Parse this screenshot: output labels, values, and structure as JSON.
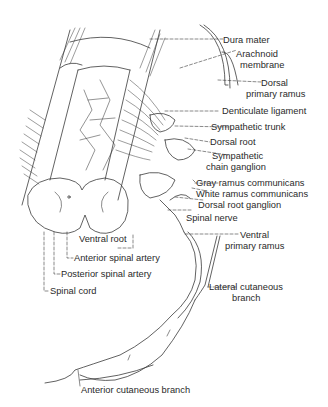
{
  "figure": {
    "line_color": "#3a3a3a",
    "background": "#ffffff"
  },
  "labels": {
    "dura_mater": "Dura mater",
    "arachnoid_membrane_1": "Arachnoid",
    "arachnoid_membrane_2": "membrane",
    "dorsal_primary_ramus_1": "Dorsal",
    "dorsal_primary_ramus_2": "primary ramus",
    "denticulate_ligament": "Denticulate ligament",
    "sympathetic_trunk": "Sympathetic trunk",
    "dorsal_root": "Dorsal root",
    "sympathetic_chain_ganglion_1": "Sympathetic",
    "sympathetic_chain_ganglion_2": "chain ganglion",
    "gray_ramus_communicans": "Gray ramus communicans",
    "white_ramus_communicans": "White ramus communicans",
    "dorsal_root_ganglion": "Dorsal root ganglion",
    "spinal_nerve": "Spinal nerve",
    "ventral_primary_ramus_1": "Ventral",
    "ventral_primary_ramus_2": "primary ramus",
    "ventral_root": "Ventral root",
    "anterior_spinal_artery": "Anterior spinal artery",
    "posterior_spinal_artery": "Posterior spinal artery",
    "spinal_cord": "Spinal cord",
    "lateral_cutaneous_branch_1": "Lateral cutaneous",
    "lateral_cutaneous_branch_2": "branch",
    "anterior_cutaneous_branch": "Anterior cutaneous branch"
  }
}
